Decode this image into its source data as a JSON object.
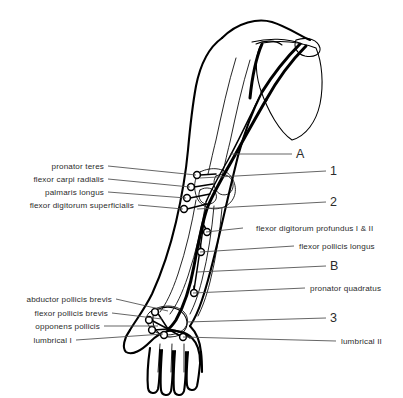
{
  "figure": {
    "background_color": "#ffffff",
    "ink_color": "#000000",
    "leader_color": "#4a4a4a"
  },
  "labels_left": [
    {
      "id": "pronator-teres",
      "text": "pronator teres",
      "text_x": 104,
      "text_y": 169,
      "line_x1": 108,
      "line_y1": 166,
      "line_x2": 196,
      "line_y2": 175
    },
    {
      "id": "flexor-carpi-radialis",
      "text": "flexor carpi radialis",
      "text_x": 104,
      "text_y": 182,
      "line_x1": 108,
      "line_y1": 179,
      "line_x2": 190,
      "line_y2": 187
    },
    {
      "id": "palmaris-longus",
      "text": "palmaris longus",
      "text_x": 104,
      "text_y": 195,
      "line_x1": 108,
      "line_y1": 192,
      "line_x2": 186,
      "line_y2": 198
    },
    {
      "id": "flexor-digitorum-superficialis",
      "text": "flexor digitorum superficialis",
      "text_x": 134,
      "text_y": 208,
      "line_x1": 138,
      "line_y1": 205,
      "line_x2": 183,
      "line_y2": 209
    }
  ],
  "labels_left_lower": [
    {
      "id": "abductor-pollicis-brevis",
      "text": "abductor pollicis brevis",
      "text_x": 112,
      "text_y": 302,
      "line_x1": 116,
      "line_y1": 299,
      "line_x2": 168,
      "line_y2": 311
    },
    {
      "id": "flexor-pollicis-brevis",
      "text": "flexor pollicis brevis",
      "text_x": 108,
      "text_y": 316,
      "line_x1": 112,
      "line_y1": 313,
      "line_x2": 162,
      "line_y2": 319
    },
    {
      "id": "opponens-pollicis",
      "text": "opponens pollicis",
      "text_x": 100,
      "text_y": 329,
      "line_x1": 104,
      "line_y1": 326,
      "line_x2": 158,
      "line_y2": 326
    },
    {
      "id": "lumbrical-i",
      "text": "lumbrical I",
      "text_x": 72,
      "text_y": 343,
      "line_x1": 76,
      "line_y1": 340,
      "line_x2": 163,
      "line_y2": 334
    }
  ],
  "labels_right": [
    {
      "id": "flexor-digitorum-profundus",
      "text": "flexor digitorum profundus I & II",
      "text_x": 256,
      "text_y": 231,
      "line_x1": 243,
      "line_y1": 228,
      "line_x2": 206,
      "line_y2": 232
    },
    {
      "id": "flexor-pollicis-longus",
      "text": "flexor pollicis longus",
      "text_x": 299,
      "text_y": 249,
      "line_x1": 294,
      "line_y1": 246,
      "line_x2": 200,
      "line_y2": 252
    },
    {
      "id": "pronator-quadratus",
      "text": "pronator quadratus",
      "text_x": 310,
      "text_y": 291,
      "line_x1": 305,
      "line_y1": 288,
      "line_x2": 193,
      "line_y2": 293
    },
    {
      "id": "lumbrical-ii",
      "text": "lumbrical II",
      "text_x": 341,
      "text_y": 344,
      "line_x1": 336,
      "line_y1": 341,
      "line_x2": 183,
      "line_y2": 337
    }
  ],
  "markers": [
    {
      "id": "marker-a",
      "text": "A",
      "text_x": 296,
      "text_y": 158,
      "line_x1": 292,
      "line_y1": 154,
      "line_x2": 230,
      "line_y2": 154
    },
    {
      "id": "marker-1",
      "text": "1",
      "text_x": 330,
      "text_y": 175,
      "line_x1": 326,
      "line_y1": 171,
      "line_x2": 200,
      "line_y2": 178
    },
    {
      "id": "marker-2",
      "text": "2",
      "text_x": 330,
      "text_y": 206,
      "line_x1": 326,
      "line_y1": 202,
      "line_x2": 197,
      "line_y2": 209
    },
    {
      "id": "marker-b",
      "text": "B",
      "text_x": 330,
      "text_y": 270,
      "line_x1": 326,
      "line_y1": 266,
      "line_x2": 197,
      "line_y2": 272
    },
    {
      "id": "marker-3",
      "text": "3",
      "text_x": 330,
      "text_y": 322,
      "line_x1": 326,
      "line_y1": 318,
      "line_x2": 186,
      "line_y2": 322
    }
  ],
  "branch_nodes": [
    {
      "id": "node-pronator-teres",
      "cx": 197,
      "cy": 175,
      "r": 3.4
    },
    {
      "id": "node-fcr",
      "cx": 191,
      "cy": 187,
      "r": 3.4
    },
    {
      "id": "node-pl",
      "cx": 187,
      "cy": 198,
      "r": 3.4
    },
    {
      "id": "node-fds",
      "cx": 184,
      "cy": 209,
      "r": 3.4
    },
    {
      "id": "node-fdp",
      "cx": 207,
      "cy": 232,
      "r": 3.4
    },
    {
      "id": "node-fpl",
      "cx": 201,
      "cy": 252,
      "r": 3.4
    },
    {
      "id": "node-pq",
      "cx": 194,
      "cy": 293,
      "r": 3.4
    },
    {
      "id": "node-apb",
      "cx": 155,
      "cy": 312,
      "r": 3.4
    },
    {
      "id": "node-fpb",
      "cx": 149,
      "cy": 320,
      "r": 3.4
    },
    {
      "id": "node-op",
      "cx": 152,
      "cy": 330,
      "r": 3.4
    },
    {
      "id": "node-lumbrical-i",
      "cx": 164,
      "cy": 335,
      "r": 3.4
    },
    {
      "id": "node-lumbrical-ii",
      "cx": 183,
      "cy": 337,
      "r": 3.4
    }
  ]
}
